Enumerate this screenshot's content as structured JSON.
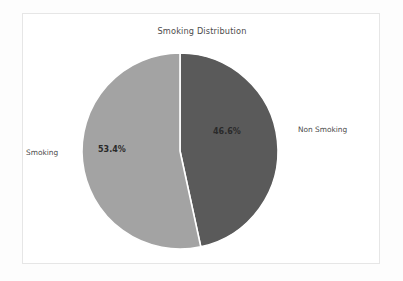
{
  "chart_data": {
    "type": "pie",
    "title": "Smoking Distribution",
    "categories": [
      "Non Smoking",
      "Smoking"
    ],
    "values": [
      46.6,
      53.4
    ],
    "value_labels": [
      "46.6%",
      "53.4%"
    ],
    "units": "percent",
    "legend": "none",
    "labels_position": "outside",
    "start_angle_deg": 90,
    "direction": "clockwise",
    "colors": [
      "#5a5a5a",
      "#a3a3a3"
    ],
    "slices": [
      {
        "name": "Non Smoking",
        "value": 46.6,
        "value_label": "46.6%",
        "color": "#5a5a5a"
      },
      {
        "name": "Smoking",
        "value": 53.4,
        "value_label": "53.4%",
        "color": "#a3a3a3"
      }
    ]
  },
  "figure": {
    "background_color": "#fdfdfd",
    "card_background_color": "#ffffff",
    "card_border_color": "#e6e6e6",
    "title_color": "#4c4c4c",
    "label_color": "#4a4a4a",
    "value_color": "#2a2a2a",
    "wedge_edge_color": "#ffffff"
  }
}
